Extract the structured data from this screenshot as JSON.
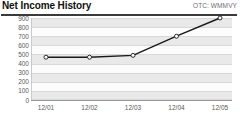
{
  "header": {
    "title": "Net Income History",
    "ticker": "OTC: WMMVY"
  },
  "chart_data": {
    "type": "line",
    "title": "Net Income History",
    "subtitle": "OTC: WMMVY",
    "xlabel": "",
    "ylabel": "",
    "categories": [
      "12/01",
      "12/02",
      "12/03",
      "12/04",
      "12/05"
    ],
    "values": [
      470,
      470,
      490,
      700,
      900
    ],
    "series": [
      {
        "name": "Net Income",
        "values": [
          470,
          470,
          490,
          700,
          900
        ]
      }
    ],
    "yticks": [
      900,
      800,
      700,
      600,
      500,
      400,
      300,
      200,
      100,
      0
    ],
    "ylim": [
      0,
      900
    ],
    "grid": true,
    "legend": false,
    "marker": "open-circle",
    "line_color": "#1a1a1a",
    "marker_fill": "#ffffff",
    "band_color": "#e9e9e9",
    "plot_background": "#fcfcfc",
    "axis_color": "#9a9a9a",
    "label_color": "#5a5a5a"
  }
}
